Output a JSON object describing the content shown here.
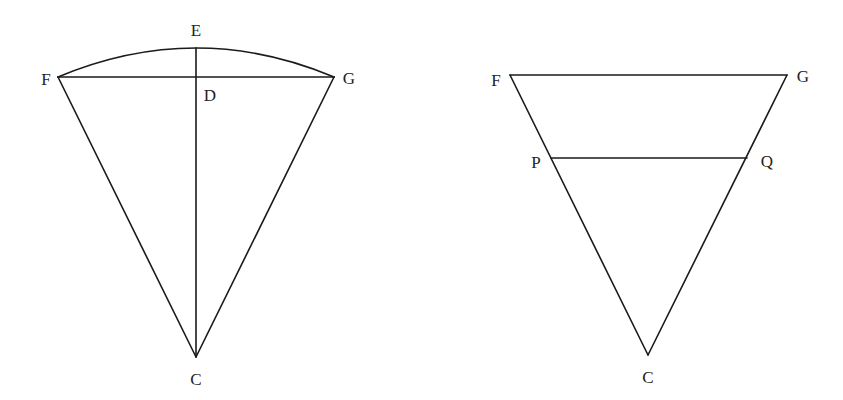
{
  "figures": [
    {
      "id": "sector-figure",
      "description": "Circular sector with center C, arc FEG, chord FG, and radius CE meeting chord at D",
      "points": {
        "F": {
          "x": 58,
          "y": 77
        },
        "G": {
          "x": 334,
          "y": 77
        },
        "E": {
          "x": 196,
          "y": 48
        },
        "D": {
          "x": 196,
          "y": 77
        },
        "C": {
          "x": 196,
          "y": 357
        }
      },
      "labels": {
        "E": "E",
        "F": "F",
        "G": "G",
        "D": "D",
        "C": "C"
      }
    },
    {
      "id": "triangle-figure",
      "description": "Inverted triangle FGC with parallel segment PQ",
      "points": {
        "F": {
          "x": 510,
          "y": 75
        },
        "G": {
          "x": 787,
          "y": 75
        },
        "P": {
          "x": 551,
          "y": 158
        },
        "Q": {
          "x": 747,
          "y": 158
        },
        "C": {
          "x": 648,
          "y": 355
        }
      },
      "labels": {
        "F": "F",
        "G": "G",
        "P": "P",
        "Q": "Q",
        "C": "C"
      }
    }
  ],
  "colors": {
    "stroke": "#1a1a1a",
    "text": "#222222",
    "background": "#ffffff"
  }
}
